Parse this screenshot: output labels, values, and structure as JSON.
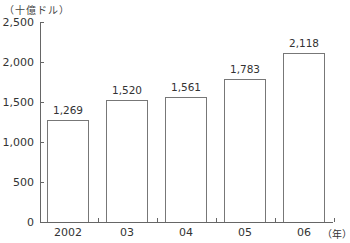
{
  "chart_data": {
    "type": "bar",
    "title": "",
    "unit_label": "（十億ドル）",
    "xlabel": "（年）",
    "ylabel": "（十億ドル）",
    "categories": [
      "2002",
      "03",
      "04",
      "05",
      "06"
    ],
    "values": [
      1269,
      1520,
      1561,
      1783,
      2118
    ],
    "value_labels": [
      "1,269",
      "1,520",
      "1,561",
      "1,783",
      "2,118"
    ],
    "yticks": [
      0,
      500,
      1000,
      1500,
      2000,
      2500
    ],
    "ytick_labels": [
      "0",
      "500",
      "1,000",
      "1,500",
      "2,000",
      "2,500"
    ],
    "ylim": [
      0,
      2500
    ],
    "grid": false,
    "legend": null,
    "bar_fill": "#ffffff",
    "bar_stroke": "#777777"
  }
}
